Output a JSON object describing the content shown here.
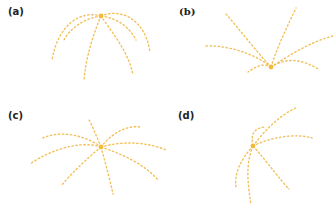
{
  "colors": {
    "curve": "#f2c05a",
    "center": "#f5b93a",
    "label": "#222222"
  },
  "panels": [
    {
      "label": "(a)",
      "center": [
        101,
        16
      ],
      "curves": [
        "M101,16 C80,10 58,25 52,60",
        "M101,16 C120,8 145,18 150,52",
        "M101,16 C95,30 86,55 84,80",
        "M101,16 C110,30 128,50 133,75",
        "M101,16 C85,18 70,28 64,40",
        "M101,16 C118,18 130,28 136,40"
      ]
    },
    {
      "label": "(b)",
      "center": [
        271,
        67
      ],
      "curves": [
        "M271,67 C255,50 240,30 226,14",
        "M271,67 C278,45 288,25 296,8",
        "M271,67 C250,50 220,45 205,46",
        "M271,67 C290,55 310,42 333,36",
        "M271,67 C285,58 300,58 318,69",
        "M271,67 C262,62 255,68 248,72"
      ]
    },
    {
      "label": "(c)",
      "center": [
        101,
        147
      ],
      "curves": [
        "M101,147 C96,135 92,125 89,120",
        "M101,147 C110,135 125,125 140,127",
        "M101,147 C85,135 60,130 43,138",
        "M101,147 C80,140 50,150 30,164",
        "M101,147 C125,140 150,143 166,150",
        "M101,147 C125,155 145,165 158,180",
        "M101,147 C106,165 110,180 113,194",
        "M101,147 C85,160 70,175 61,186"
      ]
    },
    {
      "label": "(d)",
      "center": [
        253,
        146
      ],
      "curves": [
        "M253,146 C265,130 280,115 296,108",
        "M253,146 C250,133 255,128 265,127",
        "M253,146 C275,135 300,134 312,138",
        "M253,146 C270,165 280,180 289,189",
        "M253,146 C245,165 248,185 251,205",
        "M253,146 C240,160 234,175 236,187"
      ]
    }
  ]
}
